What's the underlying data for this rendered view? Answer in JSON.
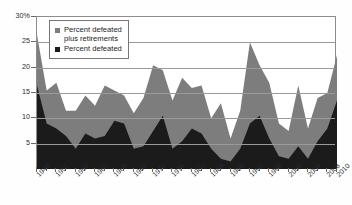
{
  "chart_data": {
    "type": "area",
    "title": "",
    "subtitle": "",
    "xlabel": "",
    "ylabel": "",
    "ylim": [
      0,
      30
    ],
    "yticks": [
      0,
      5,
      10,
      15,
      20,
      25,
      30
    ],
    "ytick_labels": [
      "",
      "5",
      "10",
      "15",
      "20",
      "25",
      "30%"
    ],
    "grid": true,
    "stacked": true,
    "legend_position": "top-left",
    "colors": {
      "percent_defeated": "#1b1b1b",
      "percent_defeated_plus_retirements": "#7d7d7d",
      "plot_border": "#8c8c8c",
      "gridline": "#9a9a9a",
      "background": "#ffffff",
      "text": "#1d1d1d"
    },
    "x": [
      1948,
      1950,
      1952,
      1954,
      1956,
      1958,
      1960,
      1962,
      1964,
      1966,
      1968,
      1970,
      1972,
      1974,
      1976,
      1978,
      1980,
      1982,
      1984,
      1986,
      1988,
      1990,
      1992,
      1994,
      1996,
      1998,
      2000,
      2002,
      2004,
      2006,
      2008,
      2010
    ],
    "xtick_labels": [
      "1948",
      "1952",
      "1956",
      "1960",
      "1964",
      "1968",
      "1972",
      "1976",
      "1980",
      "1984",
      "1988",
      "1992",
      "1996",
      "2000",
      "2004",
      "2008",
      "2010"
    ],
    "xtick_years": [
      1948,
      1952,
      1956,
      1960,
      1964,
      1968,
      1972,
      1976,
      1980,
      1984,
      1988,
      1992,
      1996,
      2000,
      2004,
      2008,
      2010
    ],
    "xtick_minor_years": [
      1950,
      1954,
      1958,
      1962,
      1966,
      1970,
      1974,
      1978,
      1982,
      1986,
      1990,
      1994,
      1998,
      2002,
      2006
    ],
    "series": [
      {
        "name": "Percent defeated",
        "key": "percent_defeated",
        "color": "#1b1b1b",
        "values": [
          16.5,
          9.0,
          8.0,
          6.5,
          4.0,
          7.0,
          6.0,
          6.5,
          9.5,
          9.0,
          4.0,
          4.5,
          7.5,
          10.5,
          4.0,
          5.5,
          8.0,
          7.0,
          4.0,
          2.0,
          1.5,
          4.0,
          9.0,
          10.5,
          6.0,
          2.5,
          2.0,
          4.5,
          2.0,
          5.5,
          8.0,
          13.5
        ]
      },
      {
        "name": "Percent defeated plus retirements",
        "key": "percent_defeated_plus_retirements",
        "color": "#7d7d7d",
        "values": [
          26.5,
          15.5,
          17.0,
          11.5,
          11.5,
          14.5,
          12.5,
          16.5,
          15.5,
          14.5,
          11.0,
          14.0,
          20.5,
          19.5,
          13.5,
          18.0,
          16.0,
          16.5,
          10.0,
          13.0,
          6.0,
          11.5,
          25.0,
          20.5,
          17.0,
          9.0,
          7.5,
          16.5,
          8.0,
          14.0,
          15.0,
          22.5
        ]
      }
    ]
  },
  "legend": {
    "items": [
      {
        "label_line1": "Percent defeated",
        "label_line2": "plus retirements",
        "swatch": "gray"
      },
      {
        "label_line1": "Percent defeated",
        "label_line2": "",
        "swatch": "black"
      }
    ]
  },
  "axis": {
    "y_top_label": "30%",
    "labels_y": [
      "30%",
      "25",
      "20",
      "15",
      "10",
      "5"
    ]
  }
}
